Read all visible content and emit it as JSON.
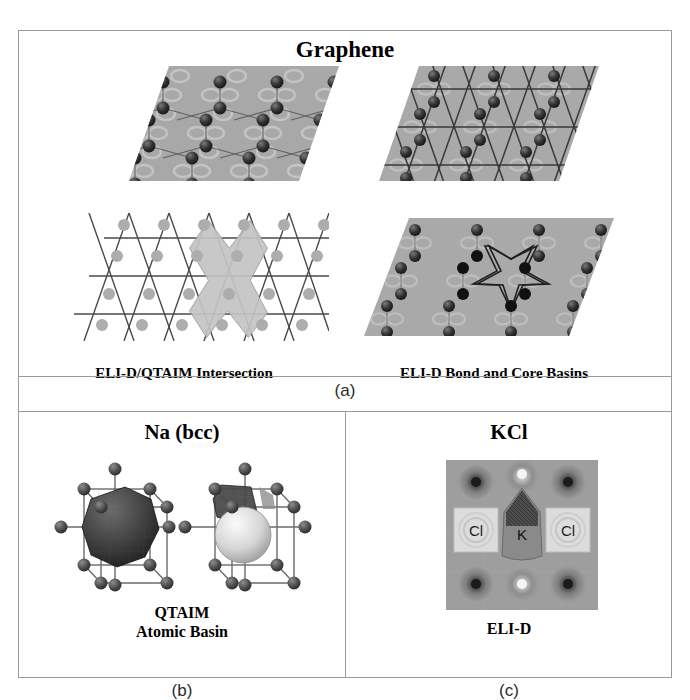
{
  "figure": {
    "sections": [
      {
        "id": "a",
        "title": "Graphene",
        "caption": "(a)",
        "panels": [
          {
            "label": "ELI-D",
            "kind": "eli-d-rhombus"
          },
          {
            "label": "QTAIM Atomic Basins",
            "kind": "qtaim-rhombus"
          },
          {
            "label": "ELI-D/QTAIM Intersection",
            "kind": "intersection-mesh"
          },
          {
            "label": "ELI-D Bond and Core Basins",
            "kind": "bond-core-rhombus"
          }
        ]
      },
      {
        "id": "b",
        "title": "Na (bcc)",
        "caption": "(b)",
        "panels": [
          {
            "label_line1": "QTAIM",
            "label_line2": "Atomic Basin",
            "kind": "bcc-clusters"
          }
        ]
      },
      {
        "id": "c",
        "title": "KCl",
        "caption": "(c)",
        "panels": [
          {
            "label": "ELI-D",
            "kind": "kcl-contour"
          }
        ],
        "atom_labels": [
          "Cl",
          "K",
          "Cl"
        ]
      }
    ]
  },
  "colors": {
    "frame": "#9a9a9a",
    "rhombus_fill": "#a8a8a8",
    "rhombus_fill_light": "#b6b6b6",
    "atom_dark": "#2b2b2b",
    "atom_mid": "#555555",
    "atom_light": "#b5b5b5",
    "mesh_line": "#4a4a4a",
    "star_fill": "#c9c9c9",
    "kcl_background": "#9e9e9e",
    "kcl_cl_box": "#dcdcdc",
    "kcl_k_region": "#8a8a8a",
    "text": "#000000"
  }
}
